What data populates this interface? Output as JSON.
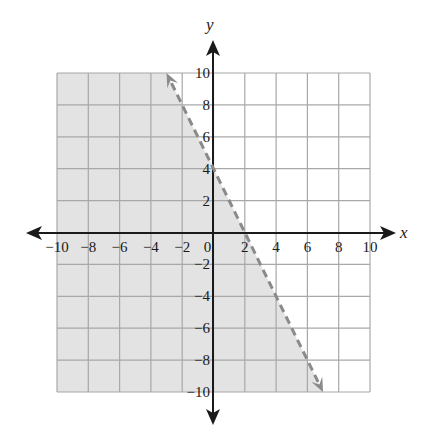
{
  "chart_data": {
    "type": "line",
    "title": "",
    "xlabel": "x",
    "ylabel": "y",
    "xlim": [
      -10,
      10
    ],
    "ylim": [
      -10,
      10
    ],
    "grid": true,
    "grid_step": 2,
    "x_ticks": [
      -10,
      -8,
      -6,
      -4,
      -2,
      0,
      2,
      4,
      6,
      8,
      10
    ],
    "y_ticks": [
      10,
      8,
      6,
      4,
      2,
      -2,
      -4,
      -6,
      -8,
      -10
    ],
    "x_tick_labels": [
      "−10",
      "−8",
      "−6",
      "−4",
      "−2",
      "0",
      "2",
      "4",
      "6",
      "8",
      "10"
    ],
    "y_tick_labels": [
      "10",
      "8",
      "6",
      "4",
      "2",
      "−2",
      "−4",
      "−6",
      "−8",
      "−10"
    ],
    "series": [
      {
        "name": "boundary line y = −2x + 4",
        "style": "dashed",
        "slope": -2,
        "intercept": 4,
        "points": [
          [
            -3,
            10
          ],
          [
            0,
            4
          ],
          [
            2,
            0
          ],
          [
            7,
            -10
          ]
        ],
        "arrows": "both"
      }
    ],
    "shaded_region": {
      "inequality": "y < −2x + 4",
      "side": "left/below line",
      "color": "#e3e3e3"
    },
    "colors": {
      "grid": "#a8a8a8",
      "axis": "#1a1a1a",
      "line": "#8a8a8a",
      "shade": "#e3e3e3"
    }
  }
}
